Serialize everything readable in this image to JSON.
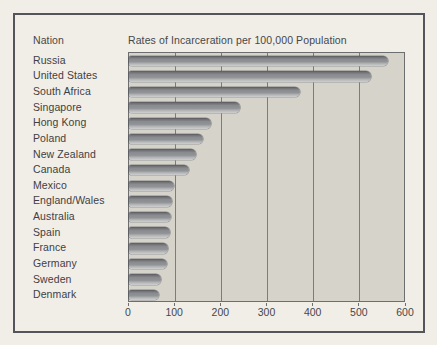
{
  "figure": {
    "nation_header": "Nation",
    "title": "Rates of Incarceration per 100,000 Population"
  },
  "chart_data": {
    "type": "bar",
    "orientation": "horizontal",
    "title": "Rates of Incarceration per 100,000 Population",
    "category_axis_label": "Nation",
    "categories": [
      "Russia",
      "United States",
      "South Africa",
      "Singapore",
      "Hong Kong",
      "Poland",
      "New Zealand",
      "Canada",
      "Mexico",
      "England/Wales",
      "Australia",
      "Spain",
      "France",
      "Germany",
      "Sweden",
      "Denmark"
    ],
    "values": [
      560,
      525,
      370,
      240,
      177,
      160,
      145,
      130,
      97,
      94,
      92,
      89,
      85,
      83,
      69,
      66
    ],
    "xlim": [
      0,
      600
    ],
    "x_ticks": [
      0,
      100,
      200,
      300,
      400,
      500,
      600
    ],
    "grid": "vertical gridlines every 100",
    "legend": "none",
    "colors": {
      "page_background": "#f1eee7",
      "frame_border": "#54555a",
      "plot_background": "#d5d3ca",
      "gridline": "#7b7c7e",
      "bar_fill": "#8a8b8f",
      "bar_highlight": "#cfcfd0",
      "bar_shadow": "#595a5f",
      "text": "#46474b"
    }
  }
}
